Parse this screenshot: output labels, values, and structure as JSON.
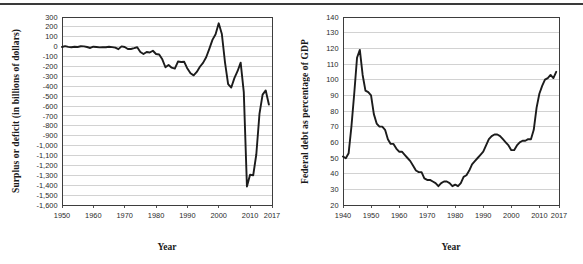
{
  "page": {
    "background_color": "#ffffff",
    "rule_color": "#3a3a3a",
    "line_color": "#1c1c1c",
    "grid_color": "#b4b4b4"
  },
  "chart_data": [
    {
      "id": "surplus-deficit",
      "type": "line",
      "title": "",
      "xlabel": "Year",
      "ylabel": "Surplus or deficit (in billions of dollars)",
      "xlim": [
        1950,
        2017
      ],
      "ylim": [
        -1600,
        300
      ],
      "grid": true,
      "legend": "none",
      "xticks": [
        1950,
        1960,
        1970,
        1980,
        1990,
        2000,
        2010,
        2017
      ],
      "xticklabels": [
        "1950",
        "1960",
        "1970",
        "1980",
        "1990",
        "2000",
        "2010",
        "2017"
      ],
      "yticks": [
        300,
        200,
        100,
        0,
        -100,
        -200,
        -300,
        -400,
        -500,
        -600,
        -700,
        -800,
        -900,
        -1000,
        -1100,
        -1200,
        -1300,
        -1400,
        -1500,
        -1600
      ],
      "yticklabels": [
        "300",
        "200",
        "100",
        "0",
        "-100",
        "-200",
        "-300",
        "-400",
        "-500",
        "-600",
        "-700",
        "-800",
        "-900",
        "-1,000",
        "-1,100",
        "-1,200",
        "-1,300",
        "-1,400",
        "-1,500",
        "-1,600"
      ],
      "x": [
        1950,
        1951,
        1952,
        1953,
        1954,
        1955,
        1956,
        1957,
        1958,
        1959,
        1960,
        1961,
        1962,
        1963,
        1964,
        1965,
        1966,
        1967,
        1968,
        1969,
        1970,
        1971,
        1972,
        1973,
        1974,
        1975,
        1976,
        1977,
        1978,
        1979,
        1980,
        1981,
        1982,
        1983,
        1984,
        1985,
        1986,
        1987,
        1988,
        1989,
        1990,
        1991,
        1992,
        1993,
        1994,
        1995,
        1996,
        1997,
        1998,
        1999,
        2000,
        2001,
        2002,
        2003,
        2004,
        2005,
        2006,
        2007,
        2008,
        2009,
        2010,
        2011,
        2012,
        2013,
        2014,
        2015,
        2016
      ],
      "values": [
        -3,
        6,
        -2,
        -6,
        -1,
        -3,
        4,
        3,
        -3,
        -13,
        0,
        -3,
        -7,
        -5,
        -6,
        -1,
        -4,
        -9,
        -25,
        3,
        -3,
        -23,
        -23,
        -15,
        -6,
        -53,
        -74,
        -54,
        -59,
        -41,
        -74,
        -79,
        -128,
        -208,
        -185,
        -212,
        -221,
        -150,
        -155,
        -153,
        -221,
        -269,
        -290,
        -255,
        -203,
        -164,
        -107,
        -22,
        69,
        126,
        236,
        128,
        -158,
        -378,
        -413,
        -318,
        -248,
        -161,
        -459,
        -1413,
        -1294,
        -1300,
        -1087,
        -680,
        -485,
        -442,
        -585
      ],
      "description": "U.S. federal surplus or deficit in billions of dollars, 1950 to 2017."
    },
    {
      "id": "federal-debt-gdp",
      "type": "line",
      "title": "",
      "xlabel": "Year",
      "ylabel": "Federal debt as percentage of GDP",
      "xlim": [
        1940,
        2017
      ],
      "ylim": [
        20,
        140
      ],
      "grid": true,
      "legend": "none",
      "xticks": [
        1940,
        1950,
        1960,
        1970,
        1980,
        1990,
        2000,
        2010,
        2017
      ],
      "xticklabels": [
        "1940",
        "1950",
        "1960",
        "1970",
        "1980",
        "1990",
        "2000",
        "2010",
        "2017"
      ],
      "yticks": [
        140,
        130,
        120,
        110,
        100,
        90,
        80,
        70,
        60,
        50,
        40,
        30,
        20
      ],
      "yticklabels": [
        "140",
        "130",
        "120",
        "110",
        "100",
        "90",
        "80",
        "70",
        "60",
        "50",
        "40",
        "30",
        "20"
      ],
      "x": [
        1940,
        1941,
        1942,
        1943,
        1944,
        1945,
        1946,
        1947,
        1948,
        1949,
        1950,
        1951,
        1952,
        1953,
        1954,
        1955,
        1956,
        1957,
        1958,
        1959,
        1960,
        1961,
        1962,
        1963,
        1964,
        1965,
        1966,
        1967,
        1968,
        1969,
        1970,
        1971,
        1972,
        1973,
        1974,
        1975,
        1976,
        1977,
        1978,
        1979,
        1980,
        1981,
        1982,
        1983,
        1984,
        1985,
        1986,
        1987,
        1988,
        1989,
        1990,
        1991,
        1992,
        1993,
        1994,
        1995,
        1996,
        1997,
        1998,
        1999,
        2000,
        2001,
        2002,
        2003,
        2004,
        2005,
        2006,
        2007,
        2008,
        2009,
        2010,
        2011,
        2012,
        2013,
        2014,
        2015,
        2016
      ],
      "values": [
        51,
        49.8,
        53,
        70,
        91,
        114,
        119,
        103,
        93,
        92,
        90,
        78,
        72,
        70,
        70,
        68,
        62,
        59,
        59,
        56,
        54,
        54,
        52,
        50,
        48,
        45,
        42,
        41,
        41,
        37,
        36,
        36,
        35,
        34,
        32,
        34,
        35,
        35,
        34,
        32,
        33,
        32,
        34,
        38,
        39,
        42,
        46,
        48,
        50,
        52,
        54,
        58,
        62,
        64,
        65,
        65,
        64,
        62,
        60,
        58,
        55,
        55,
        58,
        60,
        61,
        61,
        62,
        62,
        68,
        82,
        91,
        96,
        100,
        101,
        103,
        101,
        105
      ],
      "description": "U.S. federal debt held by the public as a percentage of GDP, 1940 to 2017."
    }
  ]
}
